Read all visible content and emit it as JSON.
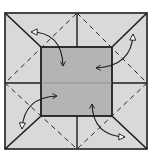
{
  "diagram": {
    "type": "origami-fold-diagram",
    "colors": {
      "background": "#ffffff",
      "paper": "#d9d9d9",
      "center_square": "#b4b4b4",
      "line": "#1e1e1e"
    },
    "outer_square": {
      "x": 5,
      "y": 13,
      "width": 142,
      "height": 136
    },
    "inner_square": {
      "x": 41,
      "y": 47,
      "width": 71,
      "height": 69
    },
    "center_lines": {
      "vertical_x": 77,
      "horizontal_y": 83
    },
    "dashed_diamond": [
      [
        77,
        13
      ],
      [
        147,
        83
      ],
      [
        77,
        149
      ],
      [
        5,
        83
      ]
    ],
    "arrows": [
      {
        "name": "top-left-fold-arrow",
        "from": [
          31,
          31
        ],
        "to": [
          63,
          66
        ]
      },
      {
        "name": "top-right-fold-arrow",
        "from": [
          133,
          35
        ],
        "to": [
          96,
          68
        ]
      },
      {
        "name": "bottom-left-fold-arrow",
        "from": [
          22,
          128
        ],
        "to": [
          57,
          96
        ]
      },
      {
        "name": "bottom-right-fold-arrow",
        "from": [
          124,
          137
        ],
        "to": [
          92,
          104
        ]
      }
    ]
  }
}
